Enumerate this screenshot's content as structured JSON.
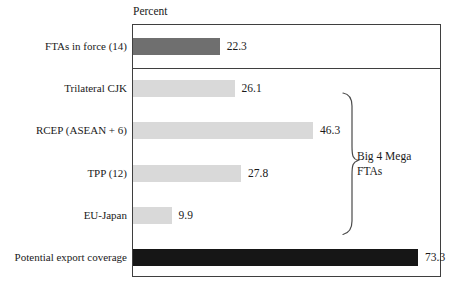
{
  "chart_data": {
    "type": "bar",
    "orientation": "horizontal",
    "unit_label": "Percent",
    "categories": [
      "FTAs in force (14)",
      "Trilateral CJK",
      "RCEP (ASEAN + 6)",
      "TPP (12)",
      "EU-Japan",
      "Potential export coverage"
    ],
    "values": [
      22.3,
      26.1,
      46.3,
      27.8,
      9.9,
      73.3
    ],
    "bar_styles": [
      "dark",
      "light",
      "light",
      "light",
      "light",
      "black"
    ],
    "colors": {
      "dark": "#6f6f6f",
      "light": "#d9d9d9",
      "black": "#161616",
      "frame": "#3f3f3f",
      "brace": "#4a4a4a",
      "text": "#1a1a1a"
    },
    "xlim": [
      0,
      78
    ],
    "grid": false,
    "value_labels_shown": true,
    "annotations": [
      {
        "name": "big-4-mega-ftas-group",
        "text_lines": [
          "Big 4 Mega",
          "FTAs"
        ],
        "grouped_categories": [
          "Trilateral CJK",
          "RCEP (ASEAN + 6)",
          "TPP (12)",
          "EU-Japan"
        ]
      }
    ]
  }
}
